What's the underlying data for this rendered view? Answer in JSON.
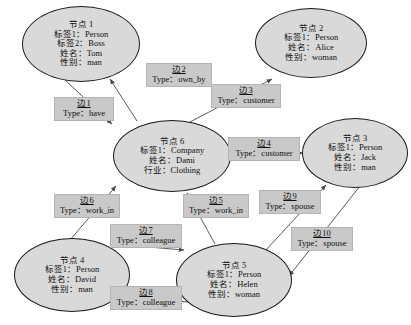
{
  "diagram": {
    "colors": {
      "node_fill": "#d9d9d9",
      "node_stroke": "#1a1a1a",
      "label_fill": "#c9c9c9",
      "label_stroke": "#b4b4b4",
      "edge_stroke": "#5a5a5a",
      "background": "#ffffff"
    }
  },
  "nodes": [
    {
      "id": "node-1",
      "title": "节点 1",
      "rows": [
        "标签1：Person",
        "标签2：Boss",
        "姓名：Tom",
        "性别：man"
      ],
      "x": 22,
      "y": 6,
      "w": 118,
      "h": 76
    },
    {
      "id": "node-2",
      "title": "节点 2",
      "rows": [
        "标签1：Person",
        "姓名：Alice",
        "性别：woman"
      ],
      "x": 255,
      "y": 8,
      "w": 112,
      "h": 70
    },
    {
      "id": "node-3",
      "title": "节点 3",
      "rows": [
        "标签1：Person",
        "姓名：Jack",
        "性别：man"
      ],
      "x": 302,
      "y": 118,
      "w": 106,
      "h": 70
    },
    {
      "id": "node-4",
      "title": "节点 4",
      "rows": [
        "标签1：Person",
        "姓名：David",
        "性别：man"
      ],
      "x": 14,
      "y": 238,
      "w": 116,
      "h": 74
    },
    {
      "id": "node-5",
      "title": "节点 5",
      "rows": [
        "标签1：Person",
        "姓名：Helen",
        "性别：woman"
      ],
      "x": 176,
      "y": 243,
      "w": 116,
      "h": 74
    },
    {
      "id": "node-6",
      "title": "节点 6",
      "rows": [
        "标签1：Company",
        "姓名：Dami",
        "行业：Clothing"
      ],
      "x": 113,
      "y": 120,
      "w": 118,
      "h": 72
    }
  ],
  "edges": [
    {
      "id": "边1",
      "type": "Type：have",
      "from": "node-1",
      "to": "node-6",
      "x": 54,
      "y": 97,
      "w": 60
    },
    {
      "id": "边2",
      "type": "Type：own_by",
      "from": "node-6",
      "to": "node-1",
      "x": 146,
      "y": 63,
      "w": 66
    },
    {
      "id": "边3",
      "type": "Type：customer",
      "from": "node-6",
      "to": "node-2",
      "x": 211,
      "y": 84,
      "w": 70
    },
    {
      "id": "边4",
      "type": "Type：customer",
      "from": "node-6",
      "to": "node-3",
      "x": 228,
      "y": 137,
      "w": 72
    },
    {
      "id": "边5",
      "type": "Type：work_in",
      "from": "node-5",
      "to": "node-6",
      "x": 183,
      "y": 194,
      "w": 66
    },
    {
      "id": "边6",
      "type": "Type：work_in",
      "from": "node-4",
      "to": "node-6",
      "x": 54,
      "y": 194,
      "w": 66
    },
    {
      "id": "边7",
      "type": "Type：colleague",
      "from": "node-4",
      "to": "node-5",
      "x": 110,
      "y": 224,
      "w": 72
    },
    {
      "id": "边8",
      "type": "Type：colleague",
      "from": "node-5",
      "to": "node-4",
      "x": 110,
      "y": 286,
      "w": 72
    },
    {
      "id": "边9",
      "type": "Type：spouse",
      "from": "node-5",
      "to": "node-3",
      "x": 259,
      "y": 190,
      "w": 62
    },
    {
      "id": "边10",
      "type": "Type：spouse",
      "from": "node-3",
      "to": "node-5",
      "x": 291,
      "y": 227,
      "w": 62
    }
  ],
  "edge_geometry": [
    {
      "id": "边1",
      "x1": 65,
      "y1": 80,
      "x2": 112,
      "y2": 124
    },
    {
      "id": "边2",
      "x1": 137,
      "y1": 121,
      "x2": 110,
      "y2": 79
    },
    {
      "id": "边3",
      "x1": 190,
      "y1": 122,
      "x2": 272,
      "y2": 79
    },
    {
      "id": "边4",
      "x1": 229,
      "y1": 155,
      "x2": 303,
      "y2": 153
    },
    {
      "id": "边5",
      "x1": 215,
      "y1": 244,
      "x2": 187,
      "y2": 193
    },
    {
      "id": "边6",
      "x1": 70,
      "y1": 240,
      "x2": 116,
      "y2": 186
    },
    {
      "id": "边7",
      "x1": 113,
      "y1": 244,
      "x2": 184,
      "y2": 250
    },
    {
      "id": "边8",
      "x1": 188,
      "y1": 302,
      "x2": 112,
      "y2": 297
    },
    {
      "id": "边9",
      "x1": 265,
      "y1": 251,
      "x2": 326,
      "y2": 185
    },
    {
      "id": "边10",
      "x1": 360,
      "y1": 186,
      "x2": 289,
      "y2": 276
    }
  ]
}
